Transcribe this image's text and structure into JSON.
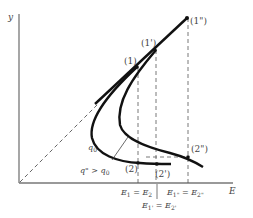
{
  "diagram": {
    "type": "phase-diagram",
    "axes": {
      "x_label": "E",
      "y_label": "y"
    },
    "curves": [
      {
        "id": "q0",
        "label": "q0",
        "label_main": "q",
        "label_sub": "0",
        "stroke": "#111111"
      },
      {
        "id": "q_double_prime",
        "label": "q\" > q0",
        "annotation_main": "q\" > q",
        "annotation_sub": "0",
        "stroke": "#111111"
      }
    ],
    "points": [
      {
        "id": "1",
        "label": "(1)"
      },
      {
        "id": "1prime",
        "label": "(1')"
      },
      {
        "id": "1doubleprime",
        "label": "(1\")"
      },
      {
        "id": "2",
        "label": "(2)"
      },
      {
        "id": "2prime",
        "label": "(2')"
      },
      {
        "id": "2doubleprime",
        "label": "(2\")"
      }
    ],
    "x_annotations": [
      {
        "id": "e1-e2",
        "text": "E1 = E2",
        "a": "E",
        "a_sub": "1",
        "eq": " = ",
        "b": "E",
        "b_sub": "2"
      },
      {
        "id": "e1p-e2p",
        "text": "E1' = E2'",
        "a": "E",
        "a_sub": "1'",
        "eq": " = ",
        "b": "E",
        "b_sub": "2'"
      },
      {
        "id": "e1pp-e2pp",
        "text": "E1\" = E2\"",
        "a": "E",
        "a_sub": "1\"",
        "eq": " = ",
        "b": "E",
        "b_sub": "2\""
      }
    ],
    "colors": {
      "axis": "#666666",
      "curve": "#111111",
      "dashed": "#555555",
      "text": "#444444"
    }
  }
}
